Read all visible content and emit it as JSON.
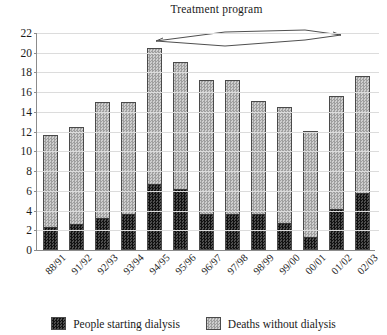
{
  "chart_data": {
    "type": "bar",
    "subtype": "stacked-vertical",
    "title": "",
    "annotation": "Treatment program",
    "xlabel": "",
    "ylabel": "",
    "ylim": [
      0,
      22
    ],
    "yticks": [
      0,
      2,
      4,
      6,
      8,
      10,
      12,
      14,
      16,
      18,
      20,
      22
    ],
    "grid": true,
    "legend_position": "bottom",
    "categories": [
      "88/91",
      "91/92",
      "92/93",
      "93/94",
      "94/95",
      "95/96",
      "96/97",
      "97/98",
      "98/99",
      "99/00",
      "00/01",
      "01/02",
      "02/03"
    ],
    "series": [
      {
        "name": "People starting dialysis",
        "color": "#1a1a1a",
        "pattern": "dark-checker",
        "values": [
          2.2,
          2.5,
          3.1,
          3.6,
          6.6,
          6.1,
          3.6,
          3.6,
          3.6,
          2.6,
          1.2,
          4.1,
          5.7
        ]
      },
      {
        "name": "Deaths without dialysis",
        "color": "#b5b5b5",
        "pattern": "light-checker",
        "values": [
          9.5,
          10.0,
          11.9,
          11.4,
          13.9,
          13.0,
          13.6,
          13.6,
          11.5,
          11.9,
          10.9,
          11.5,
          11.9
        ]
      }
    ],
    "totals": [
      11.7,
      12.5,
      15.0,
      15.0,
      20.5,
      19.1,
      17.2,
      17.2,
      15.1,
      14.5,
      12.1,
      15.6,
      17.6
    ]
  },
  "legend": {
    "items": [
      {
        "label": "People starting dialysis",
        "swatch": "dark-checker-swatch"
      },
      {
        "label": "Deaths without dialysis",
        "swatch": "light-checker-swatch"
      }
    ]
  },
  "annotation": {
    "label": "Treatment program"
  }
}
